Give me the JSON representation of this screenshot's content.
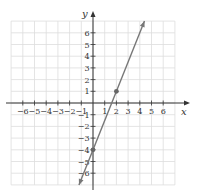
{
  "chart_data": {
    "type": "line",
    "title": "",
    "xlabel": "x",
    "ylabel": "y",
    "xlim": [
      -7,
      7
    ],
    "ylim": [
      -7,
      7
    ],
    "grid": true,
    "x_ticks": [
      -6,
      -5,
      -4,
      -3,
      -2,
      -1,
      1,
      2,
      3,
      4,
      5,
      6
    ],
    "y_ticks": [
      -6,
      -5,
      -4,
      -3,
      -2,
      -1,
      1,
      2,
      3,
      4,
      5,
      6
    ],
    "x_tick_labels": [
      "−6",
      "−5",
      "−4",
      "−3",
      "−2",
      "−1",
      "1",
      "2",
      "3",
      "4",
      "5",
      "6"
    ],
    "y_tick_labels": [
      "−6",
      "−5",
      "−4",
      "−3",
      "−2",
      "−1",
      "1",
      "2",
      "3",
      "4",
      "5",
      "6"
    ],
    "series": [
      {
        "name": "y = 2.5x − 4",
        "slope": 2.5,
        "intercept": -4,
        "x": [
          -1.2,
          4.4
        ],
        "y": [
          -7,
          7
        ],
        "arrows": "both",
        "color": "#777777"
      }
    ],
    "points": [
      {
        "x": 0,
        "y": -4
      },
      {
        "x": 2,
        "y": 1
      }
    ],
    "legend": null
  },
  "style": {
    "grid_color": "#dddddd",
    "axis_color": "#333333",
    "line_color": "#777777",
    "point_color": "#666666"
  }
}
